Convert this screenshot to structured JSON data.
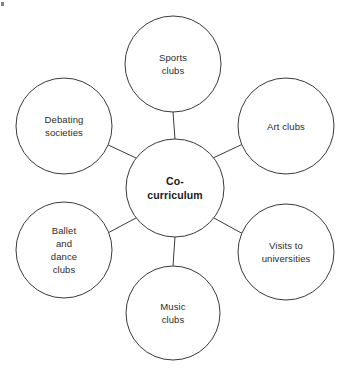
{
  "diagram": {
    "type": "hub-and-spoke",
    "background_color": "#ffffff",
    "stroke_color": "#3a3a3a",
    "text_color": "#2b2b2b",
    "stroke_width": 1,
    "center": {
      "label": "Co-\ncurriculum",
      "label_line_1": "Co-",
      "label_line_2": "curriculum",
      "bold": true,
      "cx": 175,
      "cy": 188,
      "r": 49
    },
    "nodes": [
      {
        "id": "sports-clubs",
        "label": "Sports\nclubs",
        "cx": 173,
        "cy": 64,
        "r": 48,
        "position": "top"
      },
      {
        "id": "art-clubs",
        "label": "Art clubs",
        "cx": 286,
        "cy": 126,
        "r": 48,
        "position": "top-right"
      },
      {
        "id": "visits-to-universities",
        "label": "Visits to\nuniversities",
        "cx": 286,
        "cy": 252,
        "r": 48,
        "position": "bottom-right"
      },
      {
        "id": "music-clubs",
        "label": "Music\nclubs",
        "cx": 173,
        "cy": 313,
        "r": 47,
        "position": "bottom"
      },
      {
        "id": "ballet-and-dance-clubs",
        "label": "Ballet\nand\ndance\nclubs",
        "cx": 64,
        "cy": 250,
        "r": 48,
        "position": "bottom-left"
      },
      {
        "id": "debating-societies",
        "label": "Debating\nsocieties",
        "cx": 64,
        "cy": 126,
        "r": 48,
        "position": "top-left"
      }
    ],
    "connectors": [
      {
        "id": "connector-center-sports-clubs",
        "x1": 175,
        "y1": 139,
        "x2": 173,
        "y2": 112
      },
      {
        "id": "connector-center-art-clubs",
        "x1": 213,
        "y1": 158,
        "x2": 245,
        "y2": 143
      },
      {
        "id": "connector-center-visits-to-universities",
        "x1": 214,
        "y1": 218,
        "x2": 245,
        "y2": 235
      },
      {
        "id": "connector-center-music-clubs",
        "x1": 175,
        "y1": 237,
        "x2": 173,
        "y2": 266
      },
      {
        "id": "connector-center-ballet-and-dance-clubs",
        "x1": 136,
        "y1": 218,
        "x2": 104,
        "y2": 235
      },
      {
        "id": "connector-center-debating-societies",
        "x1": 136,
        "y1": 158,
        "x2": 104,
        "y2": 143
      }
    ]
  }
}
